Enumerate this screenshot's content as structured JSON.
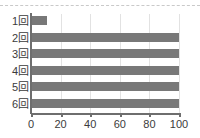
{
  "chart_data": {
    "type": "bar",
    "orientation": "horizontal",
    "title": "",
    "subtitle": "",
    "xlabel": "",
    "ylabel": "",
    "categories": [
      "1回",
      "2回",
      "3回",
      "4回",
      "5回",
      "6回"
    ],
    "values": [
      11,
      100,
      100,
      100,
      100,
      100
    ],
    "series": [
      {
        "name": "",
        "values": [
          11,
          100,
          100,
          100,
          100,
          100
        ]
      }
    ],
    "xlim": [
      0,
      100
    ],
    "xticks": [
      0,
      20,
      40,
      60,
      80,
      100
    ],
    "xtick_labels": [
      "0",
      "20",
      "40",
      "60",
      "80",
      "100"
    ],
    "ytick_labels": [
      "1回",
      "2回",
      "3回",
      "4回",
      "5回",
      "6回"
    ],
    "grid": "vertical",
    "legend": "none",
    "annotations": [],
    "colors": {
      "bar": "#787878",
      "axis": "#6e6e6e",
      "gridline": "#e2e2e2",
      "text": "#3b3b3b",
      "background": "#ffffff",
      "top_rule": "#c9c9c9"
    }
  },
  "decorations": {
    "top_rule_style": "dashed"
  }
}
